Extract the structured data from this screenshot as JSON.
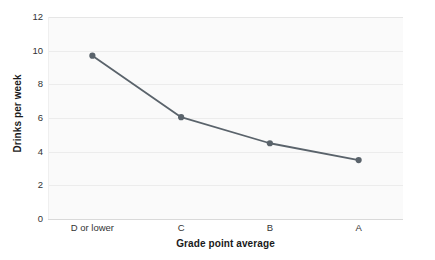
{
  "chart_data": {
    "type": "line",
    "title": "",
    "xlabel": "Grade point average",
    "ylabel": "Drinks per week",
    "categories": [
      "D or lower",
      "C",
      "B",
      "A"
    ],
    "values": [
      9.7,
      6.05,
      4.5,
      3.5
    ],
    "series": [
      {
        "name": "Drinks per week",
        "values": [
          9.7,
          6.05,
          4.5,
          3.5
        ]
      }
    ],
    "ylim": [
      0,
      12
    ],
    "yticks": [
      0,
      2,
      4,
      6,
      8,
      10,
      12
    ],
    "ytick_labels": [
      "0",
      "2",
      "4",
      "6",
      "8",
      "10",
      "12"
    ],
    "xtick_labels": [
      "D or lower",
      "C",
      "B",
      "A"
    ],
    "grid": "horizontal",
    "legend": "none",
    "marker": "circle",
    "line_color": "#5a636b",
    "marker_color": "#5a636b",
    "plot_background": "#fafafa",
    "gridline_color": "#ececec",
    "page_background": "#ffffff",
    "text_color": "#333333"
  },
  "axes": {
    "y_title": "Drinks per week",
    "x_title": "Grade point average"
  }
}
